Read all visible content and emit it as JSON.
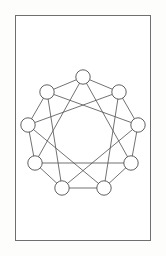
{
  "figure": {
    "title": "Enneagram circulant graph diagram",
    "background_color": "#ffffff",
    "frame": {
      "name": "figure-border",
      "x": 15,
      "y": 15,
      "width": 136,
      "height": 226,
      "stroke_color": "#6f6f72",
      "stroke_width": 1
    }
  },
  "chart_data": {
    "type": "scatter",
    "title": "",
    "subtitle": "",
    "xlabel": "",
    "ylabel": "",
    "grid": false,
    "legend_position": "none",
    "graph_name": "circulant-graph-C9-1-3",
    "node_count": 9,
    "edge_count": 18,
    "node_radius": 7.2,
    "node_fill": "#ffffff",
    "node_stroke": "#4e4e52",
    "edge_stroke": "#58585c",
    "center": {
      "x": 83,
      "y": 132
    },
    "circle_radius": 56,
    "nodes": [
      {
        "id": 0,
        "label": "",
        "x": 83,
        "y": 77
      },
      {
        "id": 1,
        "label": "",
        "x": 119,
        "y": 92
      },
      {
        "id": 2,
        "label": "",
        "x": 138,
        "y": 125
      },
      {
        "id": 3,
        "label": "",
        "x": 131,
        "y": 163
      },
      {
        "id": 4,
        "label": "",
        "x": 104,
        "y": 188
      },
      {
        "id": 5,
        "label": "",
        "x": 62,
        "y": 188
      },
      {
        "id": 6,
        "label": "",
        "x": 35,
        "y": 163
      },
      {
        "id": 7,
        "label": "",
        "x": 28,
        "y": 125
      },
      {
        "id": 8,
        "label": "",
        "x": 47,
        "y": 92
      }
    ],
    "ring_edges": [
      [
        0,
        1
      ],
      [
        1,
        2
      ],
      [
        2,
        3
      ],
      [
        3,
        4
      ],
      [
        4,
        5
      ],
      [
        5,
        6
      ],
      [
        6,
        7
      ],
      [
        7,
        8
      ],
      [
        8,
        0
      ]
    ],
    "chord_edges": [
      [
        0,
        3
      ],
      [
        1,
        4
      ],
      [
        2,
        5
      ],
      [
        3,
        6
      ],
      [
        4,
        7
      ],
      [
        5,
        8
      ],
      [
        6,
        0
      ],
      [
        7,
        1
      ],
      [
        8,
        2
      ]
    ],
    "x": [
      83,
      119,
      138,
      131,
      104,
      62,
      35,
      28,
      47
    ],
    "values": [
      77,
      92,
      125,
      163,
      188,
      188,
      163,
      125,
      92
    ],
    "categories": [
      "n0",
      "n1",
      "n2",
      "n3",
      "n4",
      "n5",
      "n6",
      "n7",
      "n8"
    ],
    "xlim": [
      15,
      151
    ],
    "ylim": [
      15,
      241
    ]
  }
}
